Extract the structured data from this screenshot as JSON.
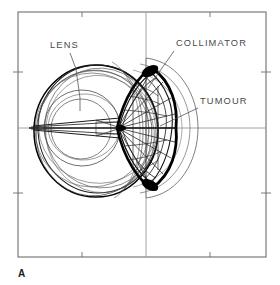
{
  "figure": {
    "panel_label": "A",
    "caption_text": "",
    "background_color": "#ffffff",
    "frame_color": "#6e6e6e",
    "axis_color": "#8a8a8a",
    "label_color": "#4a4a4a",
    "ink_color": "#000000",
    "thin_ink_color": "#3a3a3a",
    "frame": {
      "x": 18,
      "y": 12,
      "width": 248,
      "height": 245
    },
    "axes": {
      "vertical_x": 146,
      "horizontal_y": 128,
      "tick_length": 5,
      "top_ticks_x": [
        82,
        210
      ],
      "bottom_ticks_x": [
        82,
        210
      ],
      "left_ticks_y": [
        72,
        193
      ],
      "right_ticks_y": [
        72,
        193
      ]
    },
    "annotations": [
      {
        "id": "lens",
        "label": "LENS",
        "text_x": 50,
        "text_y": 48,
        "leader": [
          [
            70,
            53
          ],
          [
            76,
            69
          ],
          [
            80,
            98
          ],
          [
            80,
            111
          ]
        ],
        "interactable": false
      },
      {
        "id": "collimator",
        "label": "COLLIMATOR",
        "text_x": 176,
        "text_y": 46,
        "leader": [
          [
            174,
            51
          ],
          [
            148,
            88
          ]
        ],
        "interactable": false
      },
      {
        "id": "tumour",
        "label": "TUMOUR",
        "text_x": 200,
        "text_y": 104,
        "leader": [
          [
            198,
            108
          ],
          [
            160,
            126
          ]
        ],
        "interactable": false
      }
    ],
    "structures": {
      "globe": {
        "name": "eye-globe",
        "description": "overlapping wireframe ellipses forming the eyeball outline",
        "center_x": 96,
        "center_y": 131,
        "radius_x": 62,
        "radius_y": 66,
        "outline_count": 6
      },
      "lens": {
        "name": "crystalline-lens",
        "description": "concentric circles at anterior eye",
        "center_x": 82,
        "center_y": 128,
        "radius_outer": 38,
        "radius_inner": 30
      },
      "tumour": {
        "name": "tumour-volume",
        "description": "dark lens-shaped target volume with radiating beam rays",
        "apex_x": 117,
        "center_x": 150,
        "center_y": 128,
        "half_height": 58,
        "ray_count": 13
      },
      "collimator": {
        "name": "collimator-aperture",
        "description": "outer curved aperture outline around the tumour",
        "center_x": 155,
        "center_y": 128,
        "radius_x": 50,
        "radius_y": 70
      }
    }
  }
}
